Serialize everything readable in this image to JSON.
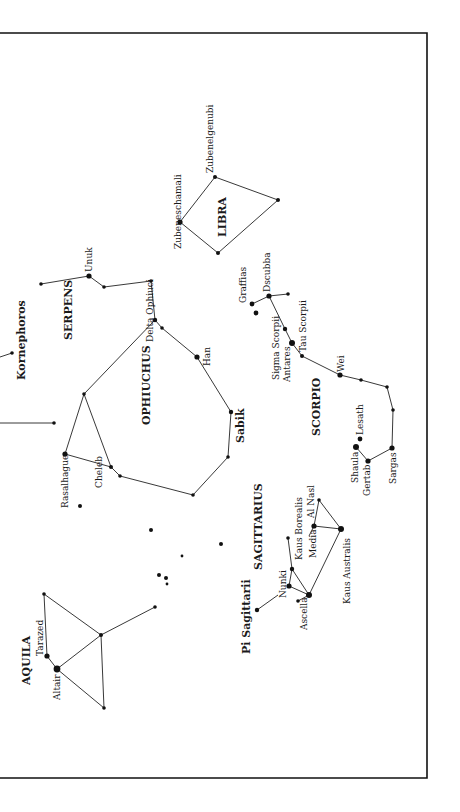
{
  "frame": {
    "top": 33,
    "bottom": 778,
    "right": 427,
    "left_open": true
  },
  "constellations": [
    {
      "name": "LIBRA",
      "label_pos": [
        228,
        215
      ]
    },
    {
      "name": "SERPENS",
      "label_pos": [
        68,
        318
      ]
    },
    {
      "name": "OPHIUCHUS",
      "label_pos": [
        146,
        398
      ]
    },
    {
      "name": "SCORPIO",
      "label_pos": [
        320,
        406
      ]
    },
    {
      "name": "SAGITTARIUS",
      "label_pos": [
        262,
        530
      ]
    },
    {
      "name": "AQUILA",
      "label_pos": [
        30,
        656
      ]
    }
  ],
  "labels": {
    "kornephoros": "Kornephoros",
    "sabik": "Sabik",
    "pi_sagittarii": "Pi Sagittarii",
    "zubenelgenubi": "Zubenelgenubi",
    "zubeneschamali": "Zubeneschamali",
    "unuk": "Unuk",
    "delta_ophiuci": "Delta Ophiuci",
    "han": "Han",
    "graffias": "Graffias",
    "dscubba": "Dscubba",
    "sigma_scorpii": "Sigma Scorpii",
    "antares": "Antares",
    "tau_scorpii": "Tau Scorpii",
    "wei": "Wei",
    "lesath": "Lesath",
    "shaula": "Shaula",
    "gertab": "Gertab",
    "sargas": "Sargas",
    "rasalhague": "Rasalhague",
    "cheleb": "Cheleb",
    "kaus_borealis": "Kaus Borealis",
    "al_nasl": "Al Nasl",
    "media": "Media",
    "kaus_australis": "Kaus Australis",
    "nunki": "Nunki",
    "ascella": "Ascella",
    "tarazed": "Tarazed",
    "altair": "Altair",
    "libra": "LIBRA",
    "serpens": "SERPENS",
    "ophiuchus": "OPHIUCHUS",
    "scorpio": "SCORPIO",
    "sagittarius": "SAGITTARIUS",
    "aquila": "AQUILA"
  },
  "colors": {
    "ink": "#111111",
    "background": "#ffffff"
  }
}
